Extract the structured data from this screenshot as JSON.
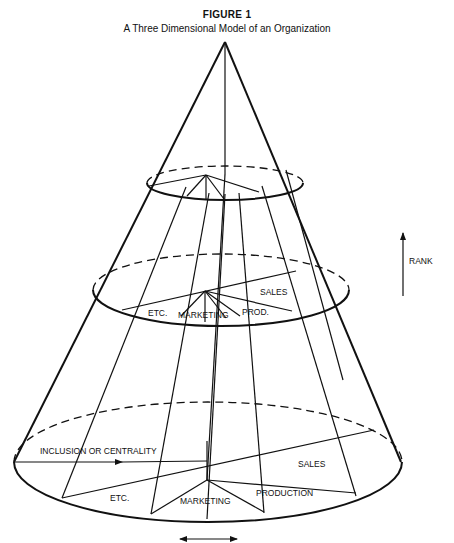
{
  "figure": {
    "title": "FIGURE 1",
    "subtitle": "A Three Dimensional Model of an Organization"
  },
  "axes": {
    "rank_label": "RANK",
    "inclusion_label": "INCLUSION OR CENTRALITY"
  },
  "middle_level": {
    "labels": {
      "sales": "SALES",
      "etc": "ETC.",
      "marketing": "MARKETING",
      "production": "PROD."
    }
  },
  "bottom_level": {
    "labels": {
      "sales": "SALES",
      "etc": "ETC.",
      "marketing": "MARKETING",
      "production": "PRODUCTION"
    }
  },
  "colors": {
    "ink": "#111111",
    "background": "#ffffff"
  }
}
